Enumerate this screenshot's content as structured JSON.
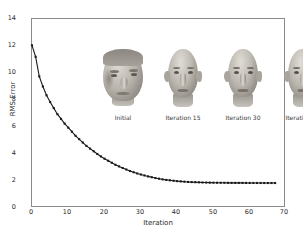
{
  "chart_data": {
    "type": "line",
    "title": "",
    "xlabel": "Iteration",
    "ylabel": "RMS Error",
    "xlim": [
      0,
      70
    ],
    "ylim": [
      0,
      14
    ],
    "xticks": [
      0,
      10,
      20,
      30,
      40,
      50,
      60,
      70
    ],
    "yticks": [
      0,
      2,
      4,
      6,
      8,
      10,
      12,
      14
    ],
    "grid": false,
    "legend": "none",
    "marker": "square",
    "marker_color": "#1a1a1a",
    "line_color": "#1a1a1a",
    "series": [
      {
        "name": "RMS Error",
        "x": [
          0,
          1,
          2,
          3,
          4,
          5,
          6,
          7,
          8,
          9,
          10,
          11,
          12,
          13,
          14,
          15,
          16,
          17,
          18,
          19,
          20,
          21,
          22,
          23,
          24,
          25,
          26,
          27,
          28,
          29,
          30,
          31,
          32,
          33,
          34,
          35,
          36,
          37,
          38,
          39,
          40,
          41,
          42,
          43,
          44,
          45,
          46,
          47,
          48,
          49,
          50,
          51,
          52,
          53,
          54,
          55,
          56,
          57,
          58,
          59,
          60,
          61,
          62,
          63,
          64,
          65,
          66,
          67
        ],
        "values": [
          12.05,
          11.2,
          9.75,
          9.0,
          8.35,
          7.85,
          7.4,
          6.95,
          6.6,
          6.25,
          5.95,
          5.65,
          5.35,
          5.1,
          4.85,
          4.6,
          4.4,
          4.2,
          4.0,
          3.82,
          3.65,
          3.5,
          3.35,
          3.2,
          3.08,
          2.96,
          2.85,
          2.74,
          2.65,
          2.56,
          2.48,
          2.41,
          2.34,
          2.28,
          2.22,
          2.17,
          2.12,
          2.08,
          2.05,
          2.02,
          1.99,
          1.97,
          1.95,
          1.93,
          1.92,
          1.91,
          1.9,
          1.89,
          1.885,
          1.88,
          1.875,
          1.87,
          1.868,
          1.866,
          1.864,
          1.862,
          1.86,
          1.859,
          1.858,
          1.857,
          1.856,
          1.855,
          1.854,
          1.853,
          1.852,
          1.851,
          1.85,
          1.85
        ]
      }
    ]
  },
  "thumbnails": [
    {
      "caption": "Initial",
      "style": "initial"
    },
    {
      "caption": "Iteration 15",
      "style": "mid"
    },
    {
      "caption": "Iteration 30",
      "style": "mid"
    },
    {
      "caption": "Iteration 45",
      "style": "final"
    }
  ],
  "axes": {
    "ylabel": "RMS Error",
    "xlabel": "Iteration",
    "ytick_labels": [
      "0",
      "2",
      "4",
      "6",
      "8",
      "10",
      "12",
      "14"
    ],
    "xtick_labels": [
      "0",
      "10",
      "20",
      "30",
      "40",
      "50",
      "60",
      "70"
    ]
  },
  "colors": {
    "background": "#ffffff",
    "frame": "#8a8a8a",
    "text": "#2b2b2b",
    "curve": "#1a1a1a"
  }
}
